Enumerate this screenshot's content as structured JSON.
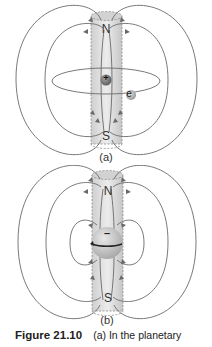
{
  "figure": {
    "number": "Figure 21.10",
    "caption_text": "(a) In the planetary"
  },
  "panel_a": {
    "label": "(a)",
    "north_label": "N",
    "south_label": "S",
    "nucleus_symbol": "+",
    "electron_symbol": "e"
  },
  "panel_b": {
    "label": "(b)",
    "north_label": "N",
    "south_label": "S",
    "charge_symbol": "–"
  },
  "colors": {
    "field_line": "#6a6a6a",
    "cylinder_fill": "#d9d9d9",
    "cylinder_dash": "#8a8a8a",
    "nucleus": "#7a7a7a",
    "electron": "#bdbdbd"
  }
}
